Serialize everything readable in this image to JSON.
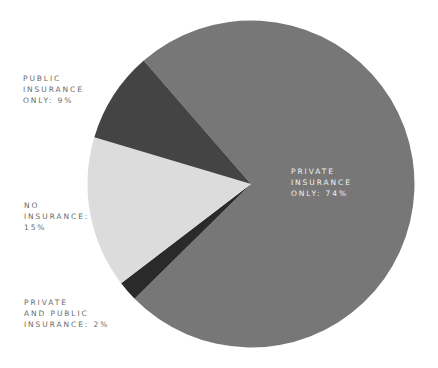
{
  "chart_data": {
    "type": "pie",
    "title": "",
    "slices": [
      {
        "label": "Private insurance only",
        "value": 74,
        "display": "PRIVATE INSURANCE ONLY: 74%",
        "color": "#777777"
      },
      {
        "label": "Private and public insurance",
        "value": 2,
        "display": "PRIVATE AND PUBLIC INSURANCE: 2%",
        "color": "#2a2a2a"
      },
      {
        "label": "No insurance",
        "value": 15,
        "display": "NO INSURANCE: 15%",
        "color": "#dcdcdc"
      },
      {
        "label": "Public insurance only",
        "value": 9,
        "display": "PUBLIC INSURANCE ONLY: 9%",
        "color": "#444444"
      }
    ],
    "start_angle_deg": 319,
    "direction": "clockwise",
    "legend": "none (direct labels)"
  },
  "labels": {
    "private_only": {
      "lines": [
        "PRIVATE",
        "INSURANCE",
        "ONLY: 74%"
      ]
    },
    "public_only": {
      "lines": [
        "PUBLIC",
        "INSURANCE",
        "ONLY: 9%"
      ]
    },
    "no_insurance": {
      "lines": [
        "NO",
        "INSURANCE:",
        "15%"
      ]
    },
    "private_and_public": {
      "lines": [
        "PRIVATE",
        "AND PUBLIC",
        "INSURANCE: 2%"
      ]
    }
  }
}
